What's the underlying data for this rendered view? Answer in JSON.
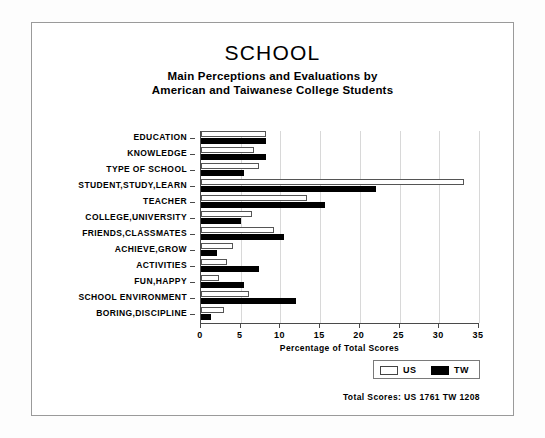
{
  "chart_data": {
    "type": "bar",
    "orientation": "horizontal",
    "title": "SCHOOL",
    "subtitle_line_1": "Main Perceptions and Evaluations by",
    "subtitle_line_2": "American and Taiwanese College Students",
    "xlabel": "Percentage of Total Scores",
    "ylabel": "",
    "xlim": [
      0,
      35
    ],
    "xticks": [
      0,
      5,
      10,
      15,
      20,
      25,
      30,
      35
    ],
    "xtick_labels": [
      "0",
      "5",
      "10",
      "15",
      "20",
      "25",
      "30",
      "35"
    ],
    "grid": true,
    "legend_position": "bottom-right",
    "categories": [
      "EDUCATION",
      "KNOWLEDGE",
      "TYPE OF SCHOOL",
      "STUDENT,STUDY,LEARN",
      "TEACHER",
      "COLLEGE,UNIVERSITY",
      "FRIENDS,CLASSMATES",
      "ACHIEVE,GROW",
      "ACTIVITIES",
      "FUN,HAPPY",
      "SCHOOL ENVIRONMENT",
      "BORING,DISCIPLINE"
    ],
    "series": [
      {
        "name": "US",
        "color": "#ffffff",
        "edge_color": "#555555",
        "values": [
          8.2,
          6.7,
          7.3,
          33.1,
          13.4,
          6.4,
          9.2,
          4.0,
          3.3,
          2.3,
          6.0,
          2.9
        ]
      },
      {
        "name": "TW",
        "color": "#000000",
        "edge_color": "#000000",
        "values": [
          8.2,
          8.2,
          5.4,
          22.0,
          15.6,
          5.0,
          10.4,
          2.0,
          7.3,
          5.4,
          12.0,
          1.3
        ]
      }
    ],
    "annotation": "Total Scores:  US 1761  TW 1208"
  },
  "legend": {
    "items": [
      {
        "label": "US"
      },
      {
        "label": "TW"
      }
    ]
  }
}
